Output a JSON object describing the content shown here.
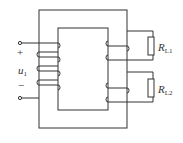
{
  "diagram": {
    "type": "transformer-circuit",
    "input": {
      "label": "u",
      "subscript": "1",
      "plus": "+",
      "minus": "−"
    },
    "loads": [
      {
        "label": "R",
        "subscript": "L1"
      },
      {
        "label": "R",
        "subscript": "L2"
      }
    ],
    "colors": {
      "line": "#333333",
      "background": "#ffffff"
    }
  }
}
